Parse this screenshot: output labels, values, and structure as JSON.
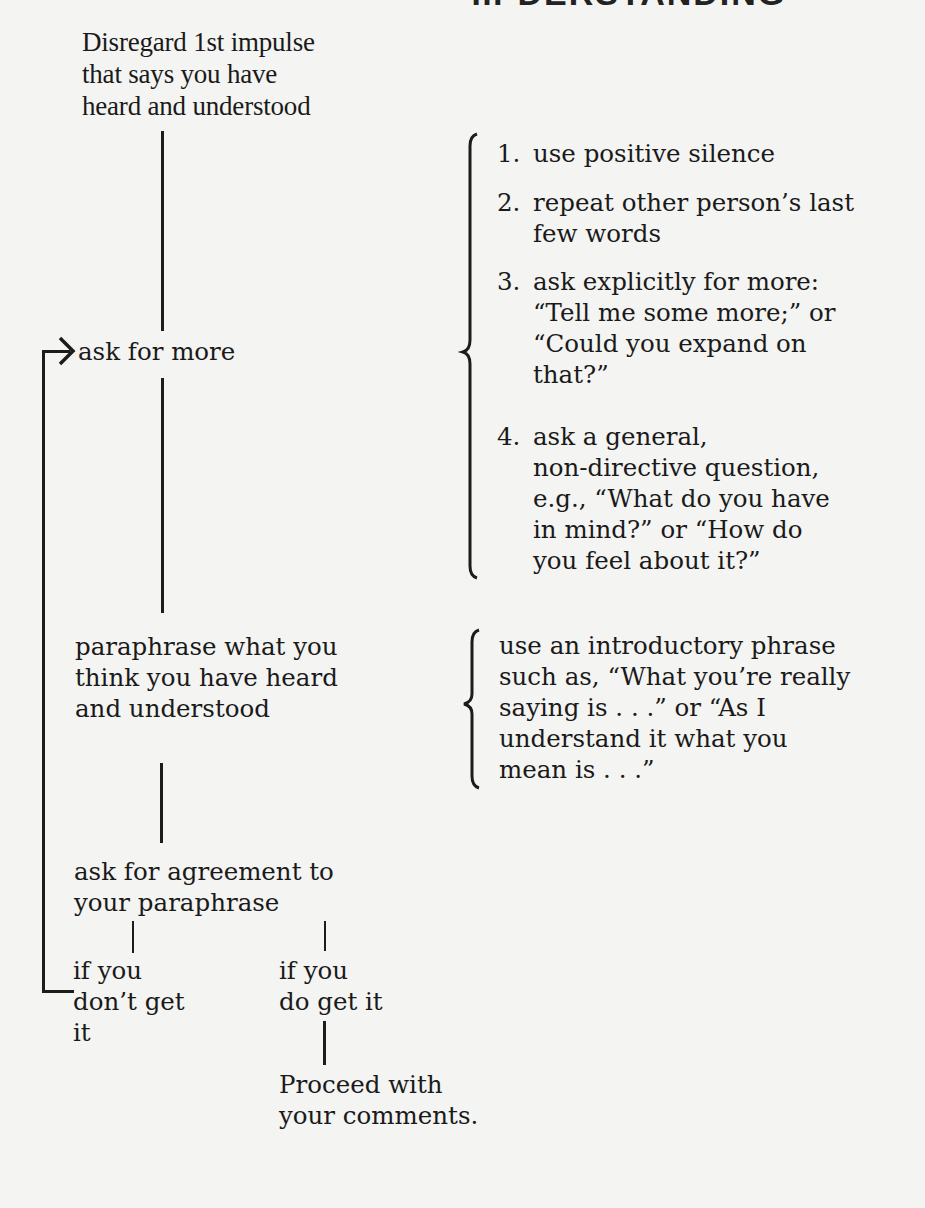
{
  "page": {
    "heading_partial": "… DERSTANDING"
  },
  "flowchart": {
    "start": "Disregard 1st impulse\nthat says you have\nheard and understood",
    "ask_more": "ask for more",
    "paraphrase": "paraphrase what you\nthink you have heard\nand understood",
    "ask_agreement": "ask for agreement to\nyour paraphrase",
    "branch_no": "if you\ndon’t get\nit",
    "branch_yes": "if you\ndo get it",
    "proceed": "Proceed with\nyour comments."
  },
  "ask_more_methods": [
    {
      "num": "1.",
      "text": "use positive silence"
    },
    {
      "num": "2.",
      "text": "repeat other person’s last\nfew words"
    },
    {
      "num": "3.",
      "text": "ask explicitly for more:\n“Tell me some more;” or\n“Could you expand on\nthat?”"
    },
    {
      "num": "4.",
      "text": "ask a general,\nnon-directive question,\ne.g., “What do you have\nin mind?” or “How do\nyou feel about it?”"
    }
  ],
  "paraphrase_tip": "use an introductory phrase\nsuch as, “What you’re really\nsaying is . . .” or “As I\nunderstand it what you\nmean is . . .”",
  "colors": {
    "ink": "#1c1c1c",
    "paper": "#f4f4f2"
  }
}
